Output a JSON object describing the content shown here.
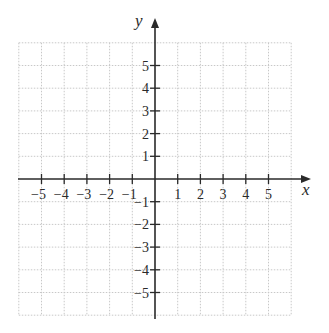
{
  "chart_data": {
    "type": "scatter",
    "title": "",
    "subtitle": "",
    "xlabel": "x",
    "ylabel": "y",
    "xlim": [
      -6,
      6
    ],
    "ylim": [
      -6,
      6
    ],
    "grid": true,
    "grid_style": "dotted",
    "legend": null,
    "x_ticks": [
      -5,
      -4,
      -3,
      -2,
      -1,
      1,
      2,
      3,
      4,
      5
    ],
    "y_ticks": [
      5,
      4,
      3,
      2,
      1,
      -1,
      -2,
      -3,
      -4,
      -5
    ],
    "x_tick_labels": [
      "−5",
      "−4",
      "−3",
      "−2",
      "−1",
      "1",
      "2",
      "3",
      "4",
      "5"
    ],
    "y_tick_labels": [
      "5",
      "4",
      "3",
      "2",
      "1",
      "−1",
      "−2",
      "−3",
      "−4",
      "−5"
    ],
    "series": [],
    "annotations": []
  },
  "colors": {
    "axis": "#2a2a2a",
    "grid": "#c8c8c8",
    "text": "#2a2a2a",
    "background": "#ffffff"
  },
  "layout": {
    "origin_px": [
      155,
      179
    ],
    "unit_px": 22.7,
    "x_axis_start_px": 18,
    "x_axis_end_px": 311,
    "y_axis_top_px": 18,
    "y_axis_bottom_px": 319
  }
}
